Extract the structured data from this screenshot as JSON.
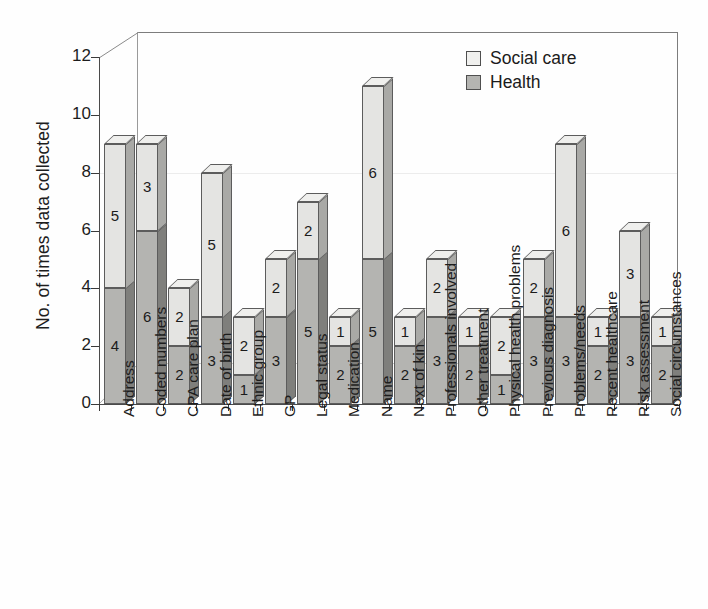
{
  "chart_data": {
    "type": "bar",
    "title": "",
    "xlabel": "",
    "ylabel": "No. of times data collected",
    "ylim": [
      0,
      12
    ],
    "yticks": [
      0,
      2,
      4,
      6,
      8,
      10,
      12
    ],
    "grid": "faint horizontal gridline at y=8",
    "legend_position": "top-right",
    "stacked": true,
    "three_d": true,
    "categories": [
      "Address",
      "Coded numbers",
      "CPA care plan",
      "Date of birth",
      "Ethnic group",
      "GP",
      "Legal status",
      "Medication",
      "Name",
      "Next of kin",
      "Professionals involved",
      "Other treatment",
      "Physical health problems",
      "Previous diagnosis",
      "Problems/needs",
      "Recent healthcare",
      "Risk assessment",
      "Social circumstances"
    ],
    "series": [
      {
        "name": "Health",
        "color": "#b4b4b1",
        "values": [
          4,
          6,
          2,
          3,
          1,
          3,
          5,
          2,
          5,
          2,
          3,
          2,
          1,
          3,
          3,
          2,
          3,
          2
        ]
      },
      {
        "name": "Social care",
        "color": "#e4e4e2",
        "values": [
          5,
          3,
          2,
          5,
          2,
          2,
          2,
          1,
          6,
          1,
          2,
          1,
          2,
          2,
          6,
          1,
          3,
          1
        ]
      }
    ],
    "totals": [
      9,
      9,
      4,
      8,
      3,
      5,
      7,
      3,
      11,
      3,
      5,
      3,
      3,
      5,
      9,
      3,
      6,
      3
    ]
  },
  "legend": {
    "items": [
      {
        "label": "Social care",
        "key": "social"
      },
      {
        "label": "Health",
        "key": "health"
      }
    ]
  },
  "axes": {
    "y_title": "No. of times data collected",
    "y_tick_labels": [
      "0",
      "2",
      "4",
      "6",
      "8",
      "10",
      "12"
    ]
  }
}
